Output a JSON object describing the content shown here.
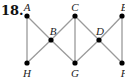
{
  "problem_number": "18.",
  "nodes": [
    {
      "id": "A",
      "label": "A",
      "x": 27,
      "y": 16,
      "lx": 27,
      "ly": 11
    },
    {
      "id": "B",
      "label": "B",
      "x": 51,
      "y": 40,
      "lx": 53,
      "ly": 35
    },
    {
      "id": "C",
      "label": "C",
      "x": 75,
      "y": 16,
      "lx": 75,
      "ly": 11
    },
    {
      "id": "D",
      "label": "D",
      "x": 99,
      "y": 40,
      "lx": 100,
      "ly": 35
    },
    {
      "id": "E",
      "label": "E",
      "x": 122,
      "y": 16,
      "lx": 124,
      "ly": 11
    },
    {
      "id": "F",
      "label": "F",
      "x": 122,
      "y": 63,
      "lx": 124,
      "ly": 77
    },
    {
      "id": "G",
      "label": "G",
      "x": 75,
      "y": 63,
      "lx": 75,
      "ly": 77
    },
    {
      "id": "H",
      "label": "H",
      "x": 27,
      "y": 63,
      "lx": 27,
      "ly": 77
    }
  ],
  "edges": [
    [
      "A",
      "H"
    ],
    [
      "A",
      "B"
    ],
    [
      "B",
      "H"
    ],
    [
      "B",
      "C"
    ],
    [
      "B",
      "G"
    ],
    [
      "C",
      "G"
    ],
    [
      "C",
      "D"
    ],
    [
      "D",
      "G"
    ],
    [
      "D",
      "E"
    ],
    [
      "D",
      "F"
    ],
    [
      "E",
      "F"
    ]
  ],
  "colors": {
    "edge": "#9a9a9a",
    "node": "#000000",
    "label": "#222222"
  }
}
